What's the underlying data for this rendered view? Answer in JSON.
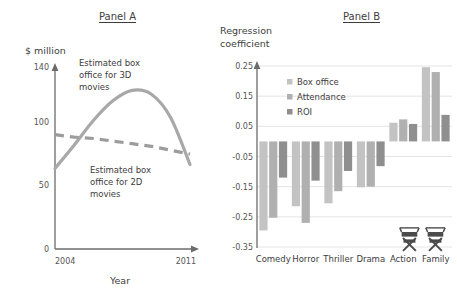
{
  "figure": {
    "background": "#ffffff",
    "text_color": "#3d3d3d"
  },
  "panel_a": {
    "title": "Panel A",
    "y_axis_label": "$ million",
    "x_axis_label": "Year",
    "y_ticks": [
      "140",
      "100",
      "50",
      "0"
    ],
    "x_ticks": [
      "2004",
      "2011"
    ],
    "annotation_3d": "Estimated box office for 3D movies",
    "annotation_2d": "Estimated box office for 2D movies",
    "series_colors": {
      "three_d": "#a8a8a8",
      "two_d": "#9c9c9c"
    }
  },
  "panel_b": {
    "title": "Panel B",
    "y_axis_label": "Regression coefficient",
    "legend": [
      "Box office",
      "Attendance",
      "ROI"
    ],
    "legend_colors": [
      "#c3c3c3",
      "#b0b0b0",
      "#8f8f8f"
    ],
    "icons": [
      "director-chair-icon",
      "director-chair-icon"
    ]
  },
  "chart_data": [
    {
      "type": "line",
      "title": "Panel A",
      "xlabel": "Year",
      "ylabel": "$ million",
      "xlim": [
        2004,
        2011
      ],
      "ylim": [
        0,
        140
      ],
      "yticks": [
        0,
        50,
        100,
        140
      ],
      "xticks": [
        2004,
        2011
      ],
      "grid": false,
      "legend": "annotations-inline",
      "series": [
        {
          "name": "Estimated box office for 3D movies",
          "style": "solid",
          "color": "#a8a8a8",
          "x": [
            2004,
            2005,
            2006,
            2007,
            2008,
            2009,
            2010,
            2011
          ],
          "values": [
            62,
            80,
            99,
            114,
            122,
            119,
            101,
            65
          ]
        },
        {
          "name": "Estimated box office for 2D movies",
          "style": "dashed",
          "color": "#9c9c9c",
          "x": [
            2004,
            2005,
            2006,
            2007,
            2008,
            2009,
            2010,
            2011
          ],
          "values": [
            88,
            86,
            85,
            83,
            81,
            79,
            76,
            73
          ]
        }
      ]
    },
    {
      "type": "bar",
      "title": "Panel B",
      "xlabel": "",
      "ylabel": "Regression coefficient",
      "ylim": [
        -0.35,
        0.25
      ],
      "yticks": [
        0.25,
        0.15,
        0.05,
        -0.05,
        -0.15,
        -0.25,
        -0.35
      ],
      "ytick_labels": [
        "0.25",
        "0.15",
        "0.05",
        "-0.05",
        "-0.15",
        "-0.25",
        "-0.35"
      ],
      "grid": true,
      "legend_position": "upper-center",
      "categories": [
        "Comedy",
        "Horror",
        "Thriller",
        "Drama",
        "Action",
        "Family"
      ],
      "series": [
        {
          "name": "Box office",
          "color": "#c3c3c3",
          "values": [
            -0.295,
            -0.215,
            -0.205,
            -0.152,
            0.062,
            0.246
          ]
        },
        {
          "name": "Attendance",
          "color": "#b0b0b0",
          "values": [
            -0.253,
            -0.27,
            -0.165,
            -0.15,
            0.073,
            0.23
          ]
        },
        {
          "name": "ROI",
          "color": "#8f8f8f",
          "values": [
            -0.12,
            -0.13,
            -0.098,
            -0.082,
            0.058,
            0.088
          ]
        }
      ]
    }
  ]
}
